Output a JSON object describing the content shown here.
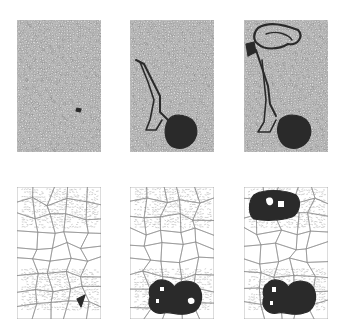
{
  "figure": {
    "colors": {
      "background": "#ffffff",
      "mesh_line": "#8a8a8a",
      "mesh_fill": "#d8d8d8",
      "dark_region": "#2a2a2a"
    },
    "panels": [
      {
        "id": "top-1",
        "row": 1,
        "col": 1,
        "x": 17,
        "y": 20,
        "w": 84,
        "h": 132,
        "stage": "initial",
        "dark_regions": [
          "small-speck"
        ]
      },
      {
        "id": "top-2",
        "row": 1,
        "col": 2,
        "x": 130,
        "y": 20,
        "w": 84,
        "h": 132,
        "stage": "intermediate",
        "dark_regions": [
          "filament",
          "blob"
        ]
      },
      {
        "id": "top-3",
        "row": 1,
        "col": 3,
        "x": 244,
        "y": 20,
        "w": 84,
        "h": 132,
        "stage": "final",
        "dark_regions": [
          "filament",
          "blob",
          "upper-loop"
        ]
      },
      {
        "id": "bottom-1",
        "row": 2,
        "col": 1,
        "x": 17,
        "y": 187,
        "w": 84,
        "h": 132,
        "stage": "initial",
        "dark_regions": [
          "small-wedge"
        ]
      },
      {
        "id": "bottom-2",
        "row": 2,
        "col": 2,
        "x": 130,
        "y": 187,
        "w": 84,
        "h": 132,
        "stage": "intermediate",
        "dark_regions": [
          "lower-cluster"
        ]
      },
      {
        "id": "bottom-3",
        "row": 2,
        "col": 3,
        "x": 244,
        "y": 187,
        "w": 84,
        "h": 132,
        "stage": "final",
        "dark_regions": [
          "upper-cluster",
          "lower-cluster"
        ]
      }
    ]
  }
}
